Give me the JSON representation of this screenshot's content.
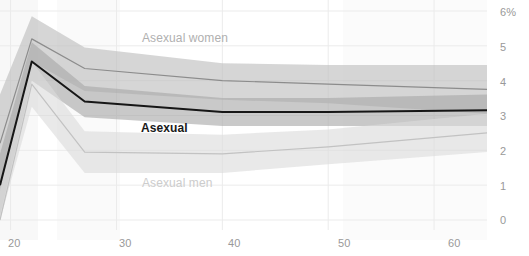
{
  "chart_data": {
    "type": "line",
    "title": "",
    "subtitle": "",
    "xlabel": "",
    "ylabel": "",
    "xlim": [
      19,
      65
    ],
    "ylim": [
      0,
      6
    ],
    "grid": true,
    "legend_position": "inline-labels",
    "x_ticks": [
      20,
      30,
      40,
      50,
      60
    ],
    "x_tick_labels": [
      "20",
      "30",
      "40",
      "50",
      "60"
    ],
    "y_ticks": [
      0,
      1,
      2,
      3,
      4,
      5,
      6
    ],
    "y_tick_labels": [
      "0",
      "1",
      "2",
      "3",
      "4",
      "5",
      "6%"
    ],
    "x": [
      19,
      22,
      27,
      40,
      50,
      65
    ],
    "series": [
      {
        "name": "Asexual women",
        "label": "Asexual women",
        "color": "#8c8c8c",
        "values": [
          2.2,
          5.2,
          4.35,
          4.0,
          3.9,
          3.75
        ],
        "band_upper": [
          3.6,
          5.85,
          4.95,
          4.5,
          4.45,
          4.45
        ],
        "band_lower": [
          0.8,
          4.55,
          3.7,
          3.45,
          3.35,
          3.05
        ],
        "band_color": "#bdbdbd"
      },
      {
        "name": "Asexual",
        "label": "Asexual",
        "color": "#161616",
        "values": [
          1.0,
          4.55,
          3.4,
          3.1,
          3.1,
          3.15
        ],
        "band_upper": [
          1.9,
          5.1,
          3.85,
          3.5,
          3.5,
          3.6
        ],
        "band_lower": [
          0.1,
          4.0,
          2.95,
          2.7,
          2.7,
          2.7
        ],
        "band_color": "#a8a8a8"
      },
      {
        "name": "Asexual men",
        "label": "Asexual men",
        "color": "#c2c2c2",
        "values": [
          0.0,
          3.9,
          1.95,
          1.9,
          2.1,
          2.5
        ],
        "band_upper": [
          0.9,
          4.55,
          2.55,
          2.45,
          2.6,
          3.05
        ],
        "band_lower": [
          0.0,
          3.25,
          1.35,
          1.35,
          1.6,
          1.95
        ],
        "band_color": "#dcdcdc"
      }
    ]
  },
  "labels": {
    "women": "Asexual women",
    "total": "Asexual",
    "men": "Asexual men"
  },
  "colors": {
    "grid": "#ebebeb",
    "tick_text": "#999999",
    "women_line": "#8c8c8c",
    "total_line": "#161616",
    "men_line": "#c2c2c2",
    "background": "#ffffff"
  }
}
